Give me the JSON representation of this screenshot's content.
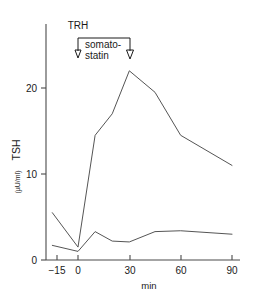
{
  "chart_data": {
    "type": "line",
    "title": "",
    "xlabel": "min",
    "ylabel": "TSH",
    "ylabel_unit": "(µU/ml)",
    "ylabel_full": "TSH (µU/ml)",
    "xlim": [
      -18,
      92
    ],
    "ylim": [
      0,
      25
    ],
    "xticks": [
      -15,
      0,
      30,
      60,
      90
    ],
    "xtick_labels": [
      "−15",
      "0",
      "30",
      "60",
      "90"
    ],
    "yticks": [
      0,
      10,
      20
    ],
    "ytick_labels": [
      "0",
      "10",
      "20"
    ],
    "grid": false,
    "legend": "none",
    "line_color": "#555555",
    "axis_color": "#4a4a4a",
    "series": [
      {
        "name": "TRH stimulated TSH",
        "x": [
          -15,
          0,
          10,
          20,
          30,
          45,
          60,
          90
        ],
        "values": [
          5.5,
          1.5,
          14.5,
          17.0,
          22.0,
          19.5,
          14.5,
          11.0
        ]
      },
      {
        "name": "TSH with somatostatin",
        "x": [
          -15,
          0,
          10,
          20,
          30,
          45,
          60,
          90
        ],
        "values": [
          1.7,
          1.0,
          3.3,
          2.2,
          2.1,
          3.3,
          3.4,
          3.0
        ]
      }
    ],
    "annotations": [
      {
        "name": "trh-arrow",
        "label": "TRH",
        "x": 0,
        "type": "down-arrow",
        "note": "TRH injection marker at time 0"
      },
      {
        "name": "somatostatin-bracket",
        "label": "somato-\nstatin",
        "label_line1": "somato-",
        "label_line2": "statin",
        "x_start": 0,
        "x_end": 30,
        "type": "bracket-with-arrows",
        "note": "somatostatin infusion from 0 to 30 min"
      }
    ]
  }
}
